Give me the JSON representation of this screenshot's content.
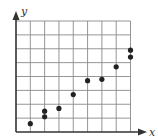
{
  "chart_data": {
    "type": "scatter",
    "title": "",
    "xlabel": "x",
    "ylabel": "y",
    "xlim": [
      0,
      8
    ],
    "ylim": [
      0,
      8
    ],
    "grid": true,
    "grid_cells": {
      "columns": 8,
      "rows": 8
    },
    "tick_labels": false,
    "legend": null,
    "points": [
      {
        "x": 1,
        "y": 0.6
      },
      {
        "x": 2,
        "y": 1.1
      },
      {
        "x": 2,
        "y": 1.5
      },
      {
        "x": 3,
        "y": 1.7
      },
      {
        "x": 4,
        "y": 2.7
      },
      {
        "x": 5,
        "y": 3.7
      },
      {
        "x": 6,
        "y": 3.8
      },
      {
        "x": 7,
        "y": 4.7
      },
      {
        "x": 8,
        "y": 5.4
      },
      {
        "x": 8,
        "y": 5.9
      }
    ]
  },
  "colors": {
    "grid": "#8a8a8a",
    "axis": "#333333",
    "point": "#222222"
  }
}
